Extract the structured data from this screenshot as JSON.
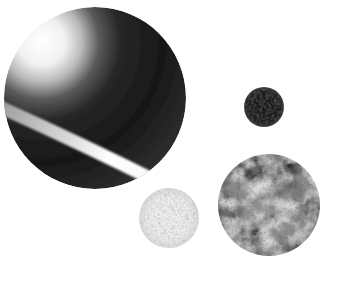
{
  "canvas": {
    "width": 340,
    "height": 291,
    "background": "#ffffff",
    "description": "Grayscale collage of four spherical objects on a plain white background; no text or UI controls visible"
  },
  "objects": [
    {
      "name": "large-ringed-sphere",
      "description": "Large dark sphere, upper-left quadrant fades to white highlight, crossed by a bright diagonal ring band from left limb down to bottom-right limb",
      "cx": 95,
      "cy": 98,
      "r": 91,
      "shading": {
        "highlight_cx": 42,
        "highlight_cy": 42,
        "gradient_radius": 168,
        "stops": [
          {
            "offset": "0",
            "color": "#ffffff"
          },
          {
            "offset": "0.14",
            "color": "#f1f1f1"
          },
          {
            "offset": "0.24",
            "color": "#b8b8b8"
          },
          {
            "offset": "0.34",
            "color": "#5a5a5a"
          },
          {
            "offset": "0.47",
            "color": "#262626"
          },
          {
            "offset": "0.72",
            "color": "#181818"
          },
          {
            "offset": "1",
            "color": "#2e2e2e"
          }
        ]
      },
      "band": {
        "path": "M 2 108 C 60 134 118 162 166 186",
        "width": 13,
        "x1": 2,
        "y1": 108,
        "x2": 166,
        "y2": 186,
        "stops": [
          {
            "offset": "0",
            "color": "#a0a0a0"
          },
          {
            "offset": "0.35",
            "color": "#d2d2d2"
          },
          {
            "offset": "0.65",
            "color": "#ffffff"
          },
          {
            "offset": "1",
            "color": "#f7f7f7"
          }
        ]
      }
    },
    {
      "name": "small-dark-sphere",
      "description": "Small near-black sphere with faint lighter speckle and soft edge",
      "cx": 264,
      "cy": 107,
      "r": 20,
      "stops": [
        {
          "offset": "0",
          "color": "#1c1c1c"
        },
        {
          "offset": "0.7",
          "color": "#1e1e1e"
        },
        {
          "offset": "0.92",
          "color": "#2b2b2b"
        },
        {
          "offset": "1",
          "color": "#454545"
        }
      ],
      "speckle_color": "#505050"
    },
    {
      "name": "light-speckled-sphere",
      "description": "Small very light gray sphere with fine granular speckle, slightly darker rim",
      "cx": 169,
      "cy": 218,
      "r": 30,
      "stops": [
        {
          "offset": "0",
          "color": "#f3f3f3"
        },
        {
          "offset": "0.72",
          "color": "#ededed"
        },
        {
          "offset": "1",
          "color": "#dadada"
        }
      ],
      "speckle_color": "#c5c5c5",
      "speckle_color_2": "#aeaeae"
    },
    {
      "name": "mottled-gray-sphere",
      "description": "Medium gray sphere with strong blotchy mottling of light and dark patches",
      "cx": 269,
      "cy": 205,
      "r": 51,
      "stops": [
        {
          "offset": "0",
          "color": "#919191"
        },
        {
          "offset": "0.85",
          "color": "#8a8a8a"
        },
        {
          "offset": "1",
          "color": "#787878"
        }
      ],
      "light_patch_color": "#dcdcdc",
      "dark_patch_color": "#2d2d2d",
      "grain_color": "#6f6f6f"
    }
  ]
}
